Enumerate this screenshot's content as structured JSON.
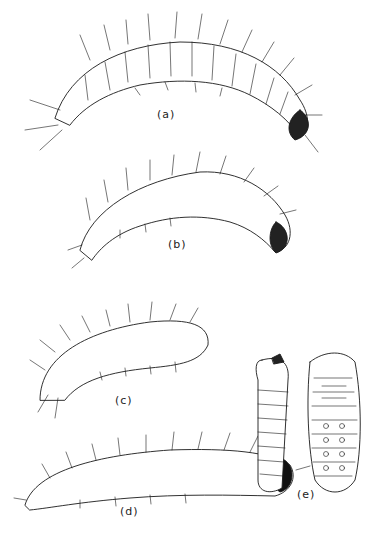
{
  "figure": {
    "panels": [
      {
        "id": "a",
        "label": "(a)",
        "description": "larva, lateral view, arched, dark head at right"
      },
      {
        "id": "b",
        "label": "(b)",
        "description": "larva, lateral view, stippled, dark head at right"
      },
      {
        "id": "c",
        "label": "(c)",
        "description": "larva, lateral view, curved"
      },
      {
        "id": "d",
        "label": "(d)",
        "description": "larva, lateral view, dark head at right"
      },
      {
        "id": "e",
        "label": "(e)",
        "description": "pupa, lateral and ventral views"
      }
    ],
    "colors": {
      "ink": "#1a1a1a",
      "paper": "#ffffff"
    }
  }
}
